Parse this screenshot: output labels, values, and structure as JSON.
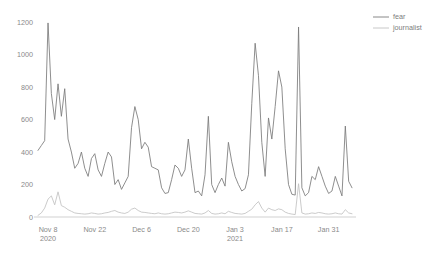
{
  "chart_data": {
    "type": "line",
    "title": "",
    "xlabel": "",
    "ylabel": "",
    "ylim": [
      0,
      1250
    ],
    "yticks": [
      0,
      200,
      400,
      600,
      800,
      1000,
      1200
    ],
    "ytick_labels": [
      "0",
      "200",
      "400",
      "600",
      "800",
      "1000",
      "1200"
    ],
    "grid": false,
    "legend_position": "top-right",
    "xtick_labels": [
      "Nov 8",
      "Nov 22",
      "Dec 6",
      "Dec 20",
      "Jan 3",
      "Jan 17",
      "Jan 31"
    ],
    "xtick_sublabels": [
      "2020",
      "",
      "",
      "",
      "2021",
      "",
      ""
    ],
    "xtick_indices": [
      3,
      17,
      31,
      45,
      59,
      73,
      87
    ],
    "x_start_date": "Nov 5 2020",
    "x_end_date": "Feb 8 2021",
    "colors": {
      "fear": "#7a7a7a",
      "journalist": "#c2c2c2",
      "axis": "#bdbdbd",
      "text": "#8a8a8a",
      "background": "#ffffff"
    },
    "series": [
      {
        "name": "fear",
        "color": "#7a7a7a",
        "values": [
          410,
          440,
          470,
          1195,
          760,
          600,
          820,
          620,
          790,
          480,
          400,
          300,
          330,
          400,
          300,
          250,
          360,
          390,
          290,
          250,
          330,
          400,
          370,
          200,
          230,
          170,
          210,
          250,
          550,
          680,
          600,
          420,
          460,
          430,
          310,
          300,
          290,
          180,
          145,
          150,
          230,
          320,
          300,
          250,
          290,
          480,
          300,
          150,
          160,
          130,
          260,
          620,
          200,
          150,
          200,
          240,
          190,
          460,
          340,
          250,
          200,
          160,
          175,
          260,
          700,
          1070,
          870,
          460,
          250,
          610,
          480,
          680,
          900,
          800,
          420,
          200,
          140,
          135,
          1170,
          180,
          130,
          150,
          250,
          230,
          310,
          250,
          190,
          145,
          160,
          250,
          190,
          130,
          560,
          220,
          180
        ]
      },
      {
        "name": "journalist",
        "color": "#c2c2c2",
        "values": [
          10,
          25,
          55,
          110,
          130,
          75,
          155,
          70,
          60,
          45,
          35,
          25,
          22,
          20,
          18,
          20,
          25,
          22,
          18,
          20,
          25,
          28,
          35,
          40,
          30,
          25,
          22,
          30,
          48,
          55,
          40,
          30,
          28,
          25,
          22,
          20,
          25,
          20,
          18,
          20,
          25,
          30,
          28,
          25,
          30,
          38,
          30,
          22,
          20,
          18,
          25,
          40,
          22,
          18,
          20,
          25,
          20,
          35,
          28,
          22,
          20,
          18,
          22,
          35,
          48,
          75,
          95,
          55,
          30,
          55,
          45,
          40,
          50,
          45,
          30,
          22,
          18,
          15,
          205,
          25,
          18,
          20,
          25,
          22,
          28,
          25,
          20,
          18,
          20,
          25,
          20,
          18,
          45,
          25,
          20
        ]
      }
    ],
    "legend": [
      {
        "label": "fear",
        "color": "#7a7a7a"
      },
      {
        "label": "journalist",
        "color": "#c2c2c2"
      }
    ]
  }
}
